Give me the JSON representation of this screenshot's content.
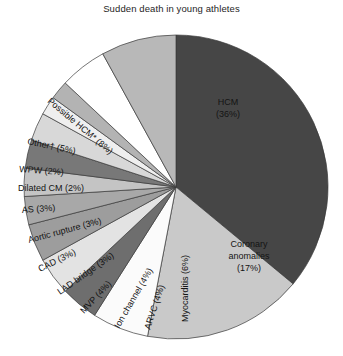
{
  "chart_data": {
    "type": "pie",
    "title": "Sudden death in young athletes",
    "xlabel": "",
    "ylabel": "",
    "legend": "none",
    "grid": false,
    "units": "percent",
    "start_angle_deg": 0,
    "direction": "clockwise",
    "categories": [
      "HCM",
      "Coronary anomalies",
      "Myocarditis",
      "ARVC",
      "Ion channel",
      "MVP",
      "LAD bridge",
      "CAD",
      "Aortic rupture",
      "AS",
      "Dilated CM",
      "WPW",
      "Other†",
      "Possible HCM*"
    ],
    "values": [
      36,
      17,
      6,
      4,
      4,
      4,
      3,
      3,
      3,
      3,
      2,
      2,
      5,
      8
    ],
    "labels": [
      "HCM\n(36%)",
      "Coronary\nanomalies\n(17%)",
      "Myocarditis (6%)",
      "ARVC (4%)",
      "Ion channel (4%)",
      "MVP (4%)",
      "LAD bridge (3%)",
      "CAD (3%)",
      "Aortic rupture (3%)",
      "AS (3%)",
      "Dilated CM (2%)",
      "WPW (2%)",
      "Other† (5%)",
      "Possible HCM* (8%)"
    ],
    "colors": [
      "#464646",
      "#c9c9c9",
      "#fbfbfb",
      "#6e6e6e",
      "#e3e3e3",
      "#9d9d9d",
      "#a8a8a8",
      "#c4c4c4",
      "#787878",
      "#d8d8d8",
      "#efefef",
      "#b3b3b3",
      "#ffffff",
      "#b8b8b8"
    ],
    "slices": [
      {
        "name": "HCM",
        "value": 36,
        "label": "HCM\n(36%)",
        "color": "#464646",
        "label_color": "#ffffff",
        "label_x": 228,
        "label_y": 105,
        "label_rotate": 0,
        "label_align": "middle",
        "label_lines": [
          "HCM",
          "(36%)"
        ],
        "font_size": 9.5
      },
      {
        "name": "Coronary anomalies",
        "value": 17,
        "label": "Coronary\nanomalies\n(17%)",
        "color": "#c9c9c9",
        "label_color": "#141414",
        "label_x": 249,
        "label_y": 247,
        "label_rotate": 0,
        "label_align": "middle",
        "label_lines": [
          "Coronary",
          "anomalies",
          "(17%)"
        ],
        "font_size": 9.5
      },
      {
        "name": "Myocarditis",
        "value": 6,
        "label": "Myocarditis (6%)",
        "color": "#fbfbfb",
        "label_color": "#141414",
        "label_x": 188,
        "label_y": 322,
        "label_rotate": -90,
        "label_align": "start",
        "label_lines": [
          "Myocarditis (6%)"
        ],
        "font_size": 8.6
      },
      {
        "name": "ARVC",
        "value": 4,
        "label": "ARVC (4%)",
        "color": "#6e6e6e",
        "label_color": "#141414",
        "label_x": 150,
        "label_y": 330,
        "label_rotate": -72,
        "label_align": "start",
        "label_lines": [
          "ARVC (4%)"
        ],
        "font_size": 8.6
      },
      {
        "name": "Ion channel",
        "value": 4,
        "label": "Ion channel (4%)",
        "color": "#e3e3e3",
        "label_color": "#141414",
        "label_x": 119,
        "label_y": 329,
        "label_rotate": -60,
        "label_align": "start",
        "label_lines": [
          "Ion channel (4%)"
        ],
        "font_size": 8.6
      },
      {
        "name": "MVP",
        "value": 4,
        "label": "MVP (4%)",
        "color": "#9d9d9d",
        "label_color": "#141414",
        "label_x": 84,
        "label_y": 314,
        "label_rotate": -47,
        "label_align": "start",
        "label_lines": [
          "MVP (4%)"
        ],
        "font_size": 8.6
      },
      {
        "name": "LAD bridge",
        "value": 3,
        "label": "LAD bridge (3%)",
        "color": "#a8a8a8",
        "label_color": "#141414",
        "label_x": 60,
        "label_y": 295,
        "label_rotate": -35,
        "label_align": "start",
        "label_lines": [
          "LAD bridge (3%)"
        ],
        "font_size": 8.6
      },
      {
        "name": "CAD",
        "value": 3,
        "label": "CAD (3%)",
        "color": "#c4c4c4",
        "label_color": "#141414",
        "label_x": 40,
        "label_y": 272,
        "label_rotate": -26,
        "label_align": "start",
        "label_lines": [
          "CAD (3%)"
        ],
        "font_size": 8.6
      },
      {
        "name": "Aortic rupture",
        "value": 3,
        "label": "Aortic rupture (3%)",
        "color": "#787878",
        "label_color": "#141414",
        "label_x": 29,
        "label_y": 243,
        "label_rotate": -15,
        "label_align": "start",
        "label_lines": [
          "Aortic rupture (3%)"
        ],
        "font_size": 8.6
      },
      {
        "name": "AS",
        "value": 3,
        "label": "AS (3%)",
        "color": "#d8d8d8",
        "label_color": "#141414",
        "label_x": 22,
        "label_y": 213,
        "label_rotate": -4,
        "label_align": "start",
        "label_lines": [
          "AS (3%)"
        ],
        "font_size": 8.8
      },
      {
        "name": "Dilated CM",
        "value": 2,
        "label": "Dilated CM (2%)",
        "color": "#efefef",
        "label_color": "#141414",
        "label_x": 18,
        "label_y": 191,
        "label_rotate": 0,
        "label_align": "start",
        "label_lines": [
          "Dilated CM (2%)"
        ],
        "font_size": 8.8
      },
      {
        "name": "WPW",
        "value": 2,
        "label": "WPW (2%)",
        "color": "#b3b3b3",
        "label_color": "#141414",
        "label_x": 19,
        "label_y": 172,
        "label_rotate": 4,
        "label_align": "start",
        "label_lines": [
          "WPW (2%)"
        ],
        "font_size": 8.8
      },
      {
        "name": "Other†",
        "value": 5,
        "label": "Other† (5%)",
        "color": "#ffffff",
        "label_color": "#141414",
        "label_x": 27,
        "label_y": 144,
        "label_rotate": 12,
        "label_align": "start",
        "label_lines": [
          "Other† (5%)"
        ],
        "font_size": 9
      },
      {
        "name": "Possible HCM*",
        "value": 8,
        "label": "Possible HCM* (8%)",
        "color": "#b8b8b8",
        "label_color": "#141414",
        "label_x": 47,
        "label_y": 102,
        "label_rotate": 40,
        "label_align": "start",
        "label_lines": [
          "Possible HCM* (8%)"
        ],
        "font_size": 9
      }
    ],
    "geometry": {
      "cx": 176,
      "cy": 187,
      "r": 152
    }
  }
}
